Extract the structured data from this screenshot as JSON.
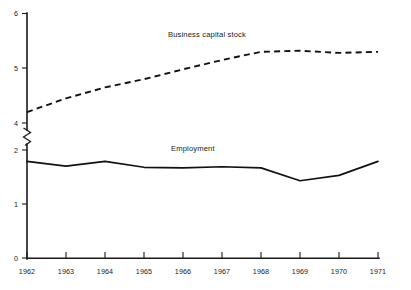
{
  "chart_data": {
    "type": "line",
    "title": "",
    "subtitle": "",
    "xlabel": "",
    "ylabel": "",
    "x": [
      1962,
      1963,
      1964,
      1965,
      1966,
      1967,
      1968,
      1969,
      1970,
      1971
    ],
    "categories": [
      "1962",
      "1963",
      "1964",
      "1965",
      "1966",
      "1967",
      "1968",
      "1969",
      "1970",
      "1971"
    ],
    "xlim": [
      1962,
      1971
    ],
    "ylim": [
      0,
      6
    ],
    "y_ticks": [
      0,
      1,
      2,
      4,
      5,
      6
    ],
    "y_tick_labels": [
      "0",
      "1",
      "2",
      "4",
      "5",
      "6"
    ],
    "axis_break": {
      "present": true,
      "between": [
        2,
        4
      ],
      "style": "zigzag"
    },
    "grid": false,
    "legend": "inline-annotations",
    "series": [
      {
        "name": "Business capital stock",
        "style": "dashed",
        "color": "#111111",
        "values": [
          4.2,
          4.45,
          4.65,
          4.8,
          4.98,
          5.15,
          5.3,
          5.32,
          5.28,
          5.3
        ],
        "label_x": 1966.0,
        "label_y": 5.75
      },
      {
        "name": "Employment",
        "style": "solid",
        "color": "#111111",
        "values": [
          1.79,
          1.7,
          1.79,
          1.68,
          1.67,
          1.69,
          1.67,
          1.43,
          1.53,
          1.79
        ],
        "label_x": 1966.0,
        "label_y": 2.02
      }
    ],
    "annotations": [
      {
        "text": "Business capital stock",
        "series": "Business capital stock"
      },
      {
        "text": "Employment",
        "series": "Employment"
      }
    ]
  },
  "axis": {
    "y_labels": [
      "6",
      "5",
      "4",
      "2",
      "1",
      "0"
    ],
    "x_labels": [
      "1962",
      "1963",
      "1964",
      "1965",
      "1966",
      "1967",
      "1968",
      "1969",
      "1970",
      "1971"
    ]
  },
  "colors": {
    "background": "#ffffff",
    "axis": "#1a1a1a",
    "series": "#111111"
  }
}
